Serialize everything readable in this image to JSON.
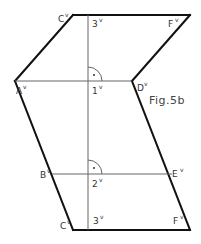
{
  "figure": {
    "caption": "Fig.5b",
    "colors": {
      "edge": "#111111",
      "construction": "#666666",
      "text": "#333333",
      "background": "#ffffff"
    }
  },
  "points": {
    "C_top": {
      "label": "C",
      "sup": "v",
      "x": 73,
      "y": 15
    },
    "F_top": {
      "label": "F",
      "sup": "v",
      "x": 190,
      "y": 15
    },
    "p3_top": {
      "label": "3",
      "sup": "v",
      "x": 88,
      "y": 15
    },
    "A": {
      "label": "A",
      "sup": "v",
      "x": 15,
      "y": 81
    },
    "D": {
      "label": "D",
      "sup": "v",
      "x": 132,
      "y": 81
    },
    "p1": {
      "label": "1",
      "sup": "v",
      "x": 88,
      "y": 81
    },
    "B": {
      "label": "B",
      "sup": "v",
      "x": 50,
      "y": 174
    },
    "E": {
      "label": "E",
      "sup": "v",
      "x": 172,
      "y": 174
    },
    "p2": {
      "label": "2",
      "sup": "v",
      "x": 88,
      "y": 174
    },
    "C_bot": {
      "label": "C",
      "sup": "v",
      "x": 73,
      "y": 230
    },
    "F_bot": {
      "label": "F",
      "sup": "v",
      "x": 190,
      "y": 230
    },
    "p3_bot": {
      "label": "3",
      "sup": "v",
      "x": 88,
      "y": 230
    }
  },
  "right_angle_marks": [
    {
      "at": "1v",
      "symbol": "·"
    },
    {
      "at": "2v",
      "symbol": "·"
    }
  ]
}
